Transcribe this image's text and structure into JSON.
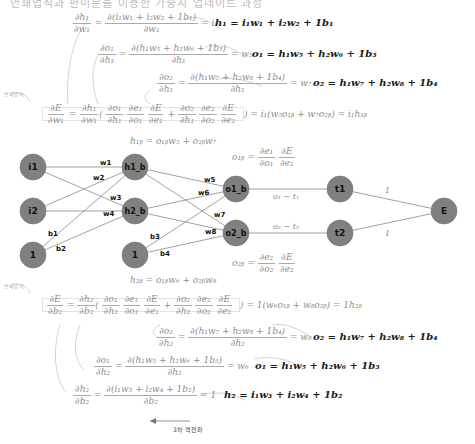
{
  "header": {
    "truncated_text": "연쇄법칙과 편미분을 이용한 가중치 업데이트 과정"
  },
  "top_block": {
    "chain_rule_label": "연쇄법칙",
    "eq_h1_w1": {
      "num": "∂h₁",
      "den": "∂w₁",
      "mid_num": "∂(i₁w₁ + i₂w₂ + 1b₁)",
      "mid_den": "∂w₁",
      "result": "= i₁"
    },
    "eq_o1_h1": {
      "num": "∂o₁",
      "den": "∂h₁",
      "mid_num": "∂(h₁w₅ + h₂w₆ + 1b₃)",
      "mid_den": "∂h₁",
      "result": "= w₅"
    },
    "eq_o2_h1": {
      "num": "∂o₂",
      "den": "∂h₁",
      "mid_num": "∂(h₁w₇ + h₂w₈ + 1b₄)",
      "mid_den": "∂h₁",
      "result": "= w₇"
    },
    "def_h1": "h₁ = i₁w₁ + i₂w₂ + 1b₁",
    "def_o1": "o₁ = h₁w₅ + h₂w₆ + 1b₃",
    "def_o2": "o₂ = h₁w₇ + h₂w₈ + 1b₄",
    "main": {
      "lhs_num": "∂E",
      "lhs_den": "∂w₁",
      "t1_num": "∂h₁",
      "t1_den": "∂w₁",
      "p1": [
        "∂o₁",
        "∂h₁",
        "∂e₁",
        "∂o₁",
        "∂E",
        "∂e₁"
      ],
      "p2": [
        "∂o₂",
        "∂h₁",
        "∂e₂",
        "∂o₂",
        "∂E",
        "∂e₂"
      ],
      "result": ") = i₁(w₅o₁ᵦ + w₇o₂ᵦ) = i₁h₁ᵦ"
    }
  },
  "network": {
    "h1b_eq": "h₁ᵦ = o₁ᵦw₅ + o₂ᵦw₇",
    "h2b_eq": "h₂ᵦ = o₁ᵦw₆ + o₂ᵦw₈",
    "o1b_eq": {
      "lhs": "o₁ᵦ =",
      "n1": "∂e₁",
      "d1": "∂o₁",
      "n2": "∂E",
      "d2": "∂e₁"
    },
    "o2b_eq": {
      "lhs": "o₂ᵦ =",
      "n1": "∂e₂",
      "d1": "∂o₂",
      "n2": "∂E",
      "d2": "∂e₂"
    },
    "e1_label": "o₁ − t₁",
    "e2_label": "o₂ − t₂",
    "nodes": [
      {
        "id": "i1",
        "label": "i1",
        "x": 33,
        "y": 167
      },
      {
        "id": "i2",
        "label": "i2",
        "x": 33,
        "y": 211
      },
      {
        "id": "bias1",
        "label": "1",
        "x": 33,
        "y": 255
      },
      {
        "id": "h1b",
        "label": "h1_b",
        "x": 135,
        "y": 167
      },
      {
        "id": "h2b",
        "label": "h2_b",
        "x": 135,
        "y": 211
      },
      {
        "id": "bias2",
        "label": "1",
        "x": 135,
        "y": 255
      },
      {
        "id": "o1b",
        "label": "o1_b",
        "x": 236,
        "y": 189
      },
      {
        "id": "o2b",
        "label": "o2_b",
        "x": 236,
        "y": 233
      },
      {
        "id": "t1",
        "label": "t1",
        "x": 340,
        "y": 189
      },
      {
        "id": "t2",
        "label": "t2",
        "x": 340,
        "y": 233
      },
      {
        "id": "E",
        "label": "E",
        "x": 444,
        "y": 211
      }
    ],
    "weights": {
      "w1": "w1",
      "w2": "w2",
      "w3": "w3",
      "w4": "w4",
      "w5": "w5",
      "w6": "w6",
      "w7": "w7",
      "w8": "w8",
      "b1": "b1",
      "b2": "b2",
      "b3": "b3",
      "b4": "b4",
      "one_top": "1",
      "one_bottom": "1"
    },
    "node_color": "#808080"
  },
  "bottom_block": {
    "chain_rule_label": "연쇄법칙",
    "main": {
      "lhs_num": "∂E",
      "lhs_den": "∂b₂",
      "t1_num": "∂h₂",
      "t1_den": "∂b₂",
      "p1": [
        "∂o₁",
        "∂h₂",
        "∂e₁",
        "∂o₁",
        "∂E",
        "∂e₁"
      ],
      "p2": [
        "∂o₂",
        "∂h₂",
        "∂e₂",
        "∂o₂",
        "∂E",
        "∂e₂"
      ],
      "result": ") = 1(w₆o₁ᵦ + w₈o₂ᵦ) = 1h₂ᵦ"
    },
    "eq_o2_h2": {
      "num": "∂o₂",
      "den": "∂h₂",
      "mid_num": "∂(h₁w₇ + h₂w₈ + 1b₄)",
      "mid_den": "∂h₂",
      "result": "= w₈"
    },
    "eq_o1_h2": {
      "num": "∂o₁",
      "den": "∂h₂",
      "mid_num": "∂(h₁w₅ + h₂w₆ + 1b₃)",
      "mid_den": "∂h₂",
      "result": "= w₆"
    },
    "eq_h2_b2": {
      "num": "∂h₂",
      "den": "∂b₂",
      "mid_num": "∂(i₁w₃ + i₂w₄ + 1b₂)",
      "mid_den": "∂b₂",
      "result": "= 1"
    },
    "def_o2": "o₂ = h₁w₇ + h₂w₈ + 1b₄",
    "def_o1": "o₁ = h₁w₅ + h₂w₆ + 1b₃",
    "def_h2": "h₂ = i₁w₃ + i₂w₄ + 1b₂"
  },
  "footer": {
    "arrow_label": "3차 역전파"
  }
}
